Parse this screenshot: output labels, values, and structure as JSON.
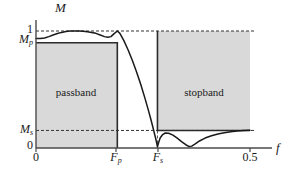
{
  "chart_data": {
    "type": "line",
    "title": "",
    "subtitle": "",
    "xlabel": "f",
    "ylabel": "M",
    "xlim": [
      0,
      0.5
    ],
    "ylim": [
      0,
      1.12
    ],
    "grid": false,
    "legend": "none",
    "axis_labels": {
      "y_axis_title": "M",
      "x_axis_title": "f"
    },
    "y_ticks": [
      {
        "id": "one",
        "label": "1",
        "value": 1.0,
        "style": "plain"
      },
      {
        "id": "mp",
        "label": "M",
        "sub": "p",
        "value": 0.9,
        "style": "italic-sub"
      },
      {
        "id": "ms",
        "label": "M",
        "sub": "s",
        "value": 0.15,
        "style": "italic-sub"
      },
      {
        "id": "zero",
        "label": "0",
        "value": 0.0,
        "style": "plain"
      }
    ],
    "x_ticks": [
      {
        "id": "zero",
        "label": "0",
        "value": 0.0,
        "style": "plain"
      },
      {
        "id": "fp",
        "label": "F",
        "sub": "p",
        "value": 0.19,
        "style": "italic-sub"
      },
      {
        "id": "fs",
        "label": "F",
        "sub": "s",
        "value": 0.2838,
        "style": "italic-sub"
      },
      {
        "id": "half",
        "label": "0.5",
        "value": 0.5,
        "style": "plain"
      }
    ],
    "regions": [
      {
        "id": "passband",
        "label": "passband",
        "x_from": 0.0,
        "x_to": 0.19,
        "y_from": 0.0,
        "y_to": 0.9,
        "fill": "#d9d9d9",
        "border": "#333333"
      },
      {
        "id": "stopband",
        "label": "stopband",
        "x_from": 0.2838,
        "x_to": 0.5,
        "y_from": 0.15,
        "y_to": 1.0,
        "fill": "#d9d9d9",
        "border": "#333333"
      }
    ],
    "reference_lines": [
      {
        "id": "unity-dashed",
        "orientation": "horizontal",
        "value": 1.0,
        "style": "dashed",
        "color": "#333333"
      },
      {
        "id": "ms-dashed",
        "orientation": "horizontal",
        "value": 0.15,
        "style": "dashed",
        "color": "#333333"
      },
      {
        "id": "fs-dashed",
        "orientation": "vertical",
        "value": 0.2838,
        "style": "dashed",
        "color": "#555555"
      }
    ],
    "series": [
      {
        "name": "magnitude-response",
        "color": "#1a1a1a",
        "points_xy": [
          [
            0.0,
            0.935
          ],
          [
            0.01,
            0.935
          ],
          [
            0.02,
            0.94
          ],
          [
            0.03,
            0.952
          ],
          [
            0.04,
            0.966
          ],
          [
            0.05,
            0.978
          ],
          [
            0.06,
            0.988
          ],
          [
            0.07,
            0.995
          ],
          [
            0.08,
            0.999
          ],
          [
            0.09,
            1.0
          ],
          [
            0.1,
            0.999
          ],
          [
            0.11,
            0.997
          ],
          [
            0.12,
            0.993
          ],
          [
            0.13,
            0.988
          ],
          [
            0.14,
            0.98
          ],
          [
            0.15,
            0.966
          ],
          [
            0.16,
            0.952
          ],
          [
            0.168,
            0.946
          ],
          [
            0.175,
            0.952
          ],
          [
            0.182,
            0.975
          ],
          [
            0.19,
            1.0
          ],
          [
            0.196,
            0.98
          ],
          [
            0.205,
            0.92
          ],
          [
            0.215,
            0.84
          ],
          [
            0.225,
            0.75
          ],
          [
            0.235,
            0.65
          ],
          [
            0.245,
            0.54
          ],
          [
            0.255,
            0.42
          ],
          [
            0.262,
            0.33
          ],
          [
            0.268,
            0.25
          ],
          [
            0.273,
            0.18
          ],
          [
            0.277,
            0.12
          ],
          [
            0.281,
            0.06
          ],
          [
            0.2838,
            0.01
          ],
          [
            0.286,
            0.04
          ],
          [
            0.29,
            0.085
          ],
          [
            0.296,
            0.115
          ],
          [
            0.302,
            0.128
          ],
          [
            0.31,
            0.126
          ],
          [
            0.32,
            0.11
          ],
          [
            0.33,
            0.085
          ],
          [
            0.34,
            0.055
          ],
          [
            0.35,
            0.028
          ],
          [
            0.358,
            0.012
          ],
          [
            0.364,
            0.016
          ],
          [
            0.372,
            0.035
          ],
          [
            0.382,
            0.06
          ],
          [
            0.395,
            0.085
          ],
          [
            0.41,
            0.105
          ],
          [
            0.425,
            0.12
          ],
          [
            0.44,
            0.131
          ],
          [
            0.455,
            0.139
          ],
          [
            0.47,
            0.145
          ],
          [
            0.485,
            0.149
          ],
          [
            0.5,
            0.151
          ]
        ]
      }
    ]
  }
}
